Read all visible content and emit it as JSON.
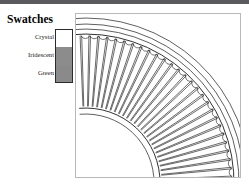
{
  "document": {
    "type": "figure-with-legend",
    "background_color": "#ffffff",
    "top_rule_color": "#5b5b5d"
  },
  "legend": {
    "title": "Swatches",
    "items": [
      {
        "label": "Crystal",
        "color": "#ffffff",
        "border_color": "#2b2b2b"
      },
      {
        "label": "Iridescent",
        "color": "#8c8c8c",
        "border_color": "#2b2b2b"
      },
      {
        "label": "Green",
        "color": "#8a8a8a",
        "border_color": "#2b2b2b"
      }
    ]
  },
  "figure": {
    "name": "radial-fan-drawing",
    "panel_border_color": "#b9b9bb",
    "line_color": "#1a1a1a",
    "center_x": 10,
    "center_y": 168,
    "hub_radius": 74,
    "hub_inner_radius": 68,
    "spoke_inner_radius": 76,
    "spoke_outer_radius": 146,
    "cusp_radius": 146,
    "rim_radii": [
      148,
      153,
      158,
      164
    ],
    "spoke_count": 26,
    "angle_start_deg": -92,
    "angle_end_deg": -2
  }
}
